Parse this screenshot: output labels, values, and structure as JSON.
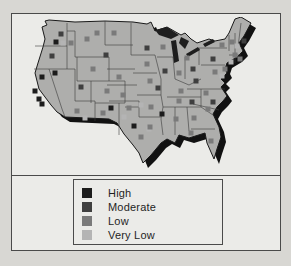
{
  "figure": {
    "region_name": "united-states-map",
    "legend": {
      "items": [
        {
          "label": "High",
          "color": "#1c1c1c"
        },
        {
          "label": "Moderate",
          "color": "#3f3f3f"
        },
        {
          "label": "Low",
          "color": "#7a7a7a"
        },
        {
          "label": "Very Low",
          "color": "#b4b4b4"
        }
      ]
    }
  },
  "colors": {
    "background": "#d8d7d3",
    "panel": "#ebebe8",
    "border": "#4a4a4a",
    "map_fill": "#aeaeac",
    "map_outline": "#1a1a1a",
    "shadow": "#111111",
    "lake": "#1e1e1e",
    "state_line": "#3a3a3a"
  },
  "map": {
    "marker_size": 5,
    "level_colors": {
      "high": "#1c1c1c",
      "moderate": "#3f3f3f",
      "low": "#7a7a7a",
      "very_low": "#b4b4b4"
    },
    "markers": [
      {
        "x": 27,
        "y": 25,
        "l": "high"
      },
      {
        "x": 32,
        "y": 17,
        "l": "moderate"
      },
      {
        "x": 34,
        "y": 26,
        "l": "very_low"
      },
      {
        "x": 23,
        "y": 39,
        "l": "moderate"
      },
      {
        "x": 13,
        "y": 60,
        "l": "high"
      },
      {
        "x": 6,
        "y": 74,
        "l": "high"
      },
      {
        "x": 10,
        "y": 82,
        "l": "high"
      },
      {
        "x": 13,
        "y": 87,
        "l": "high"
      },
      {
        "x": 26,
        "y": 56,
        "l": "high"
      },
      {
        "x": 42,
        "y": 26,
        "l": "low"
      },
      {
        "x": 58,
        "y": 22,
        "l": "low"
      },
      {
        "x": 68,
        "y": 16,
        "l": "low"
      },
      {
        "x": 85,
        "y": 16,
        "l": "low"
      },
      {
        "x": 77,
        "y": 38,
        "l": "moderate"
      },
      {
        "x": 64,
        "y": 52,
        "l": "low"
      },
      {
        "x": 52,
        "y": 70,
        "l": "moderate"
      },
      {
        "x": 90,
        "y": 60,
        "l": "low"
      },
      {
        "x": 78,
        "y": 74,
        "l": "low"
      },
      {
        "x": 94,
        "y": 78,
        "l": "low"
      },
      {
        "x": 48,
        "y": 94,
        "l": "low"
      },
      {
        "x": 56,
        "y": 101,
        "l": "very_low"
      },
      {
        "x": 74,
        "y": 96,
        "l": "low"
      },
      {
        "x": 82,
        "y": 91,
        "l": "high"
      },
      {
        "x": 100,
        "y": 91,
        "l": "low"
      },
      {
        "x": 112,
        "y": 88,
        "l": "very_low"
      },
      {
        "x": 95,
        "y": 100,
        "l": "very_low"
      },
      {
        "x": 105,
        "y": 109,
        "l": "high"
      },
      {
        "x": 112,
        "y": 120,
        "l": "low"
      },
      {
        "x": 120,
        "y": 112,
        "l": "very_low"
      },
      {
        "x": 118,
        "y": 31,
        "l": "moderate"
      },
      {
        "x": 134,
        "y": 30,
        "l": "low"
      },
      {
        "x": 118,
        "y": 47,
        "l": "low"
      },
      {
        "x": 121,
        "y": 64,
        "l": "low"
      },
      {
        "x": 129,
        "y": 71,
        "l": "moderate"
      },
      {
        "x": 122,
        "y": 90,
        "l": "low"
      },
      {
        "x": 121,
        "y": 110,
        "l": "low"
      },
      {
        "x": 136,
        "y": 54,
        "l": "moderate"
      },
      {
        "x": 150,
        "y": 56,
        "l": "low"
      },
      {
        "x": 158,
        "y": 41,
        "l": "low"
      },
      {
        "x": 164,
        "y": 52,
        "l": "moderate"
      },
      {
        "x": 152,
        "y": 74,
        "l": "low"
      },
      {
        "x": 150,
        "y": 84,
        "l": "low"
      },
      {
        "x": 163,
        "y": 85,
        "l": "moderate"
      },
      {
        "x": 133,
        "y": 97,
        "l": "high"
      },
      {
        "x": 147,
        "y": 102,
        "l": "low"
      },
      {
        "x": 165,
        "y": 101,
        "l": "low"
      },
      {
        "x": 162,
        "y": 116,
        "l": "low"
      },
      {
        "x": 182,
        "y": 124,
        "l": "low"
      },
      {
        "x": 179,
        "y": 92,
        "l": "low"
      },
      {
        "x": 184,
        "y": 85,
        "l": "moderate"
      },
      {
        "x": 177,
        "y": 76,
        "l": "low"
      },
      {
        "x": 167,
        "y": 64,
        "l": "moderate"
      },
      {
        "x": 184,
        "y": 42,
        "l": "moderate"
      },
      {
        "x": 193,
        "y": 28,
        "l": "low"
      },
      {
        "x": 215,
        "y": 24,
        "l": "moderate"
      },
      {
        "x": 203,
        "y": 25,
        "l": "low"
      },
      {
        "x": 208,
        "y": 29,
        "l": "very_low"
      },
      {
        "x": 206,
        "y": 38,
        "l": "low"
      },
      {
        "x": 211,
        "y": 42,
        "l": "low"
      },
      {
        "x": 202,
        "y": 45,
        "l": "very_low"
      },
      {
        "x": 196,
        "y": 52,
        "l": "low"
      },
      {
        "x": 186,
        "y": 55,
        "l": "low"
      },
      {
        "x": 193,
        "y": 59,
        "l": "very_low"
      }
    ]
  }
}
